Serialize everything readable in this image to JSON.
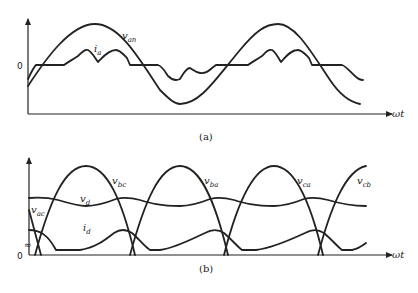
{
  "panel_a": {
    "caption": "(a)",
    "zero_label": "0",
    "x_axis_label": "ωt",
    "labels": {
      "v_an": {
        "main": "v",
        "sub": "an"
      },
      "i_a": {
        "main": "i",
        "sub": "a"
      }
    }
  },
  "panel_b": {
    "caption": "(b)",
    "zero_label": "0",
    "break_mark": "≈",
    "x_axis_label": "ωt",
    "labels": {
      "v_bc": {
        "main": "v",
        "sub": "bc"
      },
      "v_ba": {
        "main": "v",
        "sub": "ba"
      },
      "v_ca": {
        "main": "v",
        "sub": "ca"
      },
      "v_cb": {
        "main": "v",
        "sub": "cb"
      },
      "v_d": {
        "main": "v",
        "sub": "d"
      },
      "v_ac": {
        "main": "v",
        "sub": "ac"
      },
      "i_d": {
        "main": "i",
        "sub": "d"
      }
    }
  },
  "colors": {
    "ink": "#222222",
    "background": "#ffffff"
  }
}
